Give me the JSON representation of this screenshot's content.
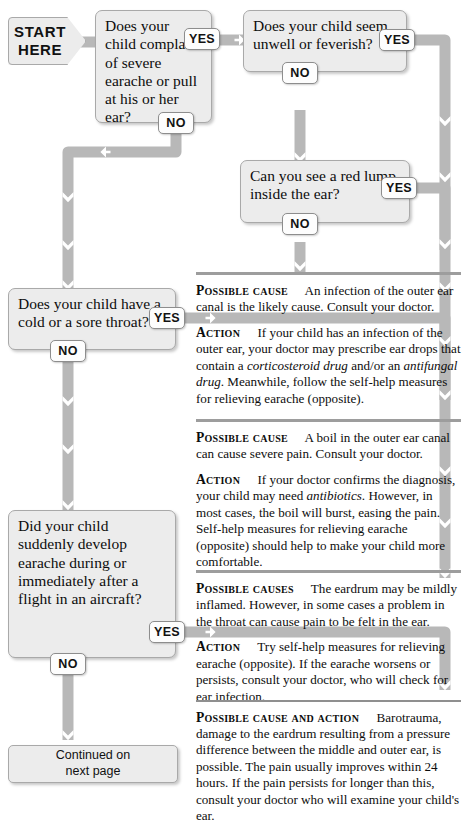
{
  "palette": {
    "box_fill": "#ececec",
    "box_border": "#a9a9a9",
    "connector": "#b8b8b8",
    "rule": "#9d9d9d",
    "text": "#0d0d0d",
    "pill_fill": "#fdfdfd"
  },
  "start": {
    "line1": "START",
    "line2": "HERE"
  },
  "labels": {
    "yes": "YES",
    "no": "NO"
  },
  "questions": [
    {
      "id": "q1-earache-or-pull-ear",
      "text": "Does your child complain of severe earache or pull at his or her ear?"
    },
    {
      "id": "q2-unwell-feverish",
      "text": "Does your child seem unwell or feverish?"
    },
    {
      "id": "q3-red-lump",
      "text": "Can you see a red lump inside the ear?"
    },
    {
      "id": "q4-cold-sore-throat",
      "text": "Does your child have a cold or a sore throat?"
    },
    {
      "id": "q5-flight-aircraft",
      "text": "Did your child suddenly develop earache during or immediately after a flight in an aircraft?"
    }
  ],
  "answers": [
    {
      "id": "outer-ear-canal-infection",
      "cause_lead": "Possible cause",
      "cause_text": "An infection of the outer ear canal is the likely cause. Consult your doctor.",
      "action_lead": "Action",
      "action_parts": [
        {
          "t": "If your child has an infection of the outer ear, your doctor may prescribe ear drops that contain a ",
          "i": false
        },
        {
          "t": "corticosteroid drug",
          "i": true
        },
        {
          "t": " and/or an ",
          "i": false
        },
        {
          "t": "antifungal drug",
          "i": true
        },
        {
          "t": ". Meanwhile, follow the self-help measures for relieving earache (opposite).",
          "i": false
        }
      ]
    },
    {
      "id": "boil-outer-ear-canal",
      "cause_lead": "Possible cause",
      "cause_text": "A boil in the outer ear canal can cause severe pain. Consult your doctor.",
      "action_lead": "Action",
      "action_parts": [
        {
          "t": "If your doctor confirms the diagnosis, your child may need ",
          "i": false
        },
        {
          "t": "antibiotics",
          "i": true
        },
        {
          "t": ". However, in most cases, the boil will burst, easing the pain. Self-help measures for relieving earache (opposite) should help to make your child more comfortable.",
          "i": false
        }
      ]
    },
    {
      "id": "eardrum-inflamed-throat",
      "cause_lead": "Possible causes",
      "cause_text": "The eardrum may be mildly inflamed. However, in some cases a problem in the throat can cause pain to be felt in the ear.",
      "action_lead": "Action",
      "action_parts": [
        {
          "t": "Try self-help measures for relieving earache (opposite). If the earache worsens or persists, consult your doctor, who will check for ear infection.",
          "i": false
        }
      ]
    },
    {
      "id": "barotrauma",
      "cause_lead": "Possible cause and action",
      "cause_text": "Barotrauma, damage to the eardrum resulting from a pressure difference between the middle and outer ear, is possible. The pain usually improves within 24 hours. If the pain persists for longer than this, consult your doctor who will examine your child's ear.",
      "action_lead": "",
      "action_parts": []
    }
  ],
  "footer": {
    "continued": "Continued on\nnext page"
  }
}
